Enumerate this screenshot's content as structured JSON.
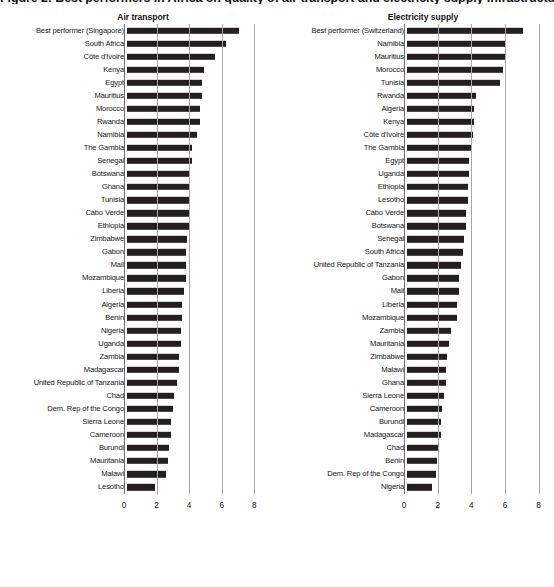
{
  "figure": {
    "title": "Figure 2: Best performers in Africa on quality of air transport and electricity supply infrastructure, 2016",
    "background": "#ffffff",
    "bar_color": "#231f20",
    "grid_color": "#a8a8a8"
  },
  "chart_data": [
    {
      "type": "bar",
      "orientation": "horizontal",
      "title": "Air transport",
      "xlabel": "",
      "ylabel": "",
      "xlim": [
        0,
        8.6
      ],
      "xticks": [
        0,
        2,
        4,
        6,
        8
      ],
      "xticklabels": [
        "0",
        "2",
        "4",
        "6",
        "8"
      ],
      "grid": true,
      "legend": "none",
      "categories": [
        "Best performer (Singapore)",
        "South Africa",
        "Côte d'Ivoire",
        "Kenya",
        "Egypt",
        "Mauritius",
        "Morocco",
        "Rwanda",
        "Namibia",
        "The Gambia",
        "Senegal",
        "Botswana",
        "Ghana",
        "Tunisia",
        "Cabo Verde",
        "Ethiopia",
        "Zimbabwe",
        "Gabon",
        "Mali",
        "Mozambique",
        "Liberia",
        "Algeria",
        "Benin",
        "Nigeria",
        "Uganda",
        "Zambia",
        "Madagascar",
        "United Republic of Tanzania",
        "Chad",
        "Dem. Rep of the Congo",
        "Sierra Leone",
        "Cameroon",
        "Burundi",
        "Mauritania",
        "Malawi",
        "Lesotho"
      ],
      "values": [
        6.9,
        6.1,
        5.4,
        4.7,
        4.6,
        4.6,
        4.5,
        4.5,
        4.3,
        4.0,
        4.0,
        3.9,
        3.9,
        3.9,
        3.8,
        3.8,
        3.7,
        3.6,
        3.6,
        3.6,
        3.5,
        3.4,
        3.4,
        3.3,
        3.3,
        3.2,
        3.2,
        3.1,
        2.9,
        2.8,
        2.7,
        2.7,
        2.6,
        2.5,
        2.4,
        1.7
      ]
    },
    {
      "type": "bar",
      "orientation": "horizontal",
      "title": "Electricity supply",
      "xlabel": "",
      "ylabel": "",
      "xlim": [
        0,
        8.2
      ],
      "xticks": [
        0,
        2,
        4,
        6,
        8
      ],
      "xticklabels": [
        "0",
        "2",
        "4",
        "6",
        "8"
      ],
      "grid": true,
      "legend": "none",
      "categories": [
        "Best performer (Switzerland)",
        "Namibia",
        "Mauritius",
        "Morocco",
        "Tunisia",
        "Rwanda",
        "Algeria",
        "Kenya",
        "Côte d'Ivoire",
        "The Gambia",
        "Egypt",
        "Uganda",
        "Ethiopia",
        "Lesotho",
        "Cabo Verde",
        "Botswana",
        "Senegal",
        "South Africa",
        "United Republic of Tanzania",
        "Gabon",
        "Mali",
        "Liberia",
        "Mozambique",
        "Zambia",
        "Mauritania",
        "Zimbabwe",
        "Malawi",
        "Ghana",
        "Sierra Leone",
        "Cameroon",
        "Burundi",
        "Madagascar",
        "Chad",
        "Benin",
        "Dem. Rep of the Congo",
        "Nigeria"
      ],
      "values": [
        6.9,
        5.9,
        5.8,
        5.7,
        5.5,
        4.1,
        4.0,
        4.0,
        3.9,
        3.8,
        3.7,
        3.7,
        3.6,
        3.6,
        3.5,
        3.5,
        3.4,
        3.3,
        3.2,
        3.1,
        3.1,
        3.0,
        3.0,
        2.6,
        2.5,
        2.4,
        2.3,
        2.3,
        2.2,
        2.1,
        2.0,
        2.0,
        1.9,
        1.8,
        1.7,
        1.5
      ]
    }
  ]
}
